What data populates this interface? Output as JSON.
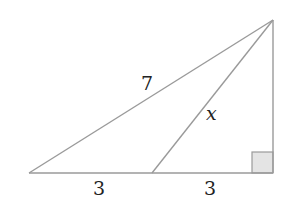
{
  "diagram": {
    "type": "geometry-right-triangle",
    "colors": {
      "line": "#9a9a9a",
      "text": "#222222",
      "right_angle_fill": "#e4e4e4",
      "background": "#ffffff"
    },
    "points": {
      "left": [
        29,
        173
      ],
      "mid": [
        152,
        173
      ],
      "right_foot": [
        273,
        173
      ],
      "apex": [
        273,
        20
      ]
    },
    "labels": {
      "hypotenuse": "7",
      "cevian": "x",
      "base_left": "3",
      "base_right": "3"
    },
    "right_angle_marker": {
      "x": 252,
      "y": 152,
      "size": 21
    }
  }
}
